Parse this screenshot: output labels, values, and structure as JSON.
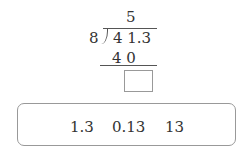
{
  "division": {
    "quotient": "5",
    "divisor": "8",
    "dividend": "4 1.3",
    "subtract": "4 0",
    "remainder_placeholder": ""
  },
  "choices": [
    "1.3",
    "0.13",
    "13"
  ]
}
